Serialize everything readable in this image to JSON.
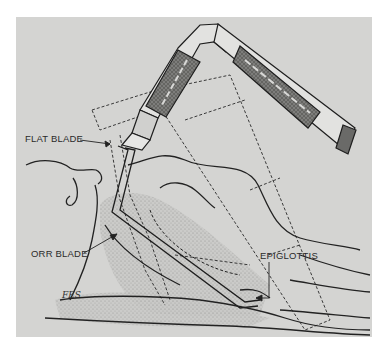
{
  "figure": {
    "labels": {
      "flat_blade": "FLAT BLADE",
      "orr_blade": "ORR BLADE",
      "epiglottis": "EPIGLOTTIS"
    },
    "signature": "FES"
  },
  "colors": {
    "background": "#ffffff",
    "panel": "#d4d4d2",
    "ink": "#2a2a2a",
    "shading": "#9a9a98"
  }
}
